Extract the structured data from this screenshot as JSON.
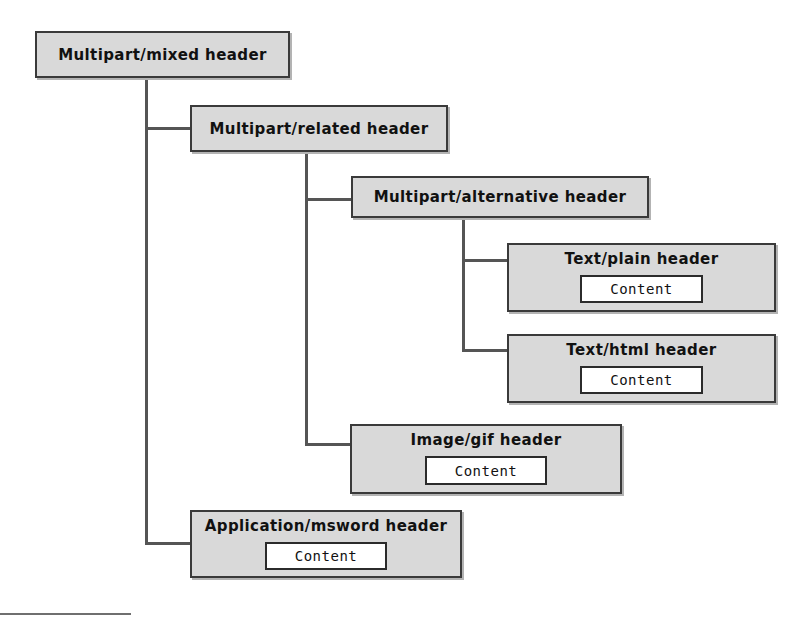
{
  "diagram": {
    "type": "tree",
    "colors": {
      "node_fill": "#d9d9d9",
      "node_border": "#3a3a3a",
      "content_fill": "#ffffff",
      "content_border": "#2b2b2b",
      "connector": "#555555",
      "background": "#ffffff"
    },
    "nodes": [
      {
        "id": "multipart-mixed",
        "label": "Multipart/mixed header",
        "content": null,
        "depth": 0
      },
      {
        "id": "multipart-related",
        "label": "Multipart/related header",
        "content": null,
        "depth": 1
      },
      {
        "id": "multipart-alternative",
        "label": "Multipart/alternative header",
        "content": null,
        "depth": 2
      },
      {
        "id": "text-plain",
        "label": "Text/plain header",
        "content": "Content",
        "depth": 3
      },
      {
        "id": "text-html",
        "label": "Text/html header",
        "content": "Content",
        "depth": 3
      },
      {
        "id": "image-gif",
        "label": "Image/gif header",
        "content": "Content",
        "depth": 2
      },
      {
        "id": "application-msword",
        "label": "Application/msword header",
        "content": "Content",
        "depth": 1
      }
    ],
    "edges": [
      {
        "from": "multipart-mixed",
        "to": "multipart-related"
      },
      {
        "from": "multipart-mixed",
        "to": "application-msword"
      },
      {
        "from": "multipart-related",
        "to": "multipart-alternative"
      },
      {
        "from": "multipart-related",
        "to": "image-gif"
      },
      {
        "from": "multipart-alternative",
        "to": "text-plain"
      },
      {
        "from": "multipart-alternative",
        "to": "text-html"
      }
    ]
  }
}
